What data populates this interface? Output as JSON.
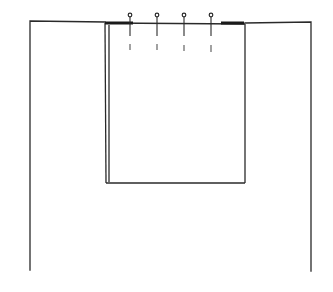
{
  "diagram": {
    "colors": {
      "background": "#ffffff",
      "line": "#2a2a2a",
      "thick_line": "#1a1a1a",
      "dash": "#555555"
    },
    "outer_frame": {
      "left_x": 30,
      "right_x": 311,
      "top_left_y": 21,
      "top_right_y": 22,
      "bottom_left_y": 270,
      "bottom_right_y": 271,
      "opening_left_x": 105,
      "opening_right_x": 245
    },
    "panel": {
      "left_x": 105,
      "inner_left_x": 109,
      "right_x": 245,
      "top_y": 24,
      "bottom_y": 183,
      "thick_top_segments": [
        {
          "x1": 105,
          "x2": 133
        },
        {
          "x1": 221,
          "x2": 244
        }
      ]
    },
    "pins": [
      {
        "x": 130,
        "head_y": 15,
        "shaft_end_y": 36,
        "dash_y1": 44,
        "dash_y2": 50
      },
      {
        "x": 157,
        "head_y": 15,
        "shaft_end_y": 36,
        "dash_y1": 44,
        "dash_y2": 50
      },
      {
        "x": 184,
        "head_y": 15,
        "shaft_end_y": 36,
        "dash_y1": 45,
        "dash_y2": 51
      },
      {
        "x": 211,
        "head_y": 15,
        "shaft_end_y": 36,
        "dash_y1": 45,
        "dash_y2": 52
      }
    ]
  }
}
